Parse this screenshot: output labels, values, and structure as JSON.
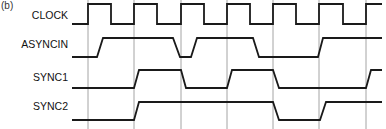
{
  "figure": {
    "label": "(b)"
  },
  "signals": [
    {
      "name": "CLOCK",
      "label_y": 9
    },
    {
      "name": "ASYNCIN",
      "label_y": 38
    },
    {
      "name": "SYNC1",
      "label_y": 71
    },
    {
      "name": "SYNC2",
      "label_y": 100
    }
  ],
  "gridlines_x": [
    88,
    134,
    181,
    227,
    273,
    319,
    366
  ],
  "waveforms": {
    "CLOCK": "M72,24 L88,24 L88,4 L111,4 L111,24 L134,24 L134,4 L157,4 L157,24 L181,24 L181,4 L204,4 L204,24 L227,24 L227,4 L250,4 L250,24 L273,24 L273,4 L296,4 L296,24 L319,24 L319,4 L343,4 L343,24 L366,24 L366,4 L382,4",
    "ASYNCIN": "M72,57 L97,57 L103,38 L173,38 L180,57 L191,57 L197,38 L253,38 L259,57 L318,57 L323,38 L382,38",
    "SYNC1": "M72,88 L134,88 L139,70 L181,70 L186,88 L227,88 L232,70 L273,70 L279,88 L366,88 L371,70 L382,70",
    "SYNC2": "M72,120 L134,120 L139,102 L273,102 L279,120 L320,120 L326,102 L382,102"
  }
}
